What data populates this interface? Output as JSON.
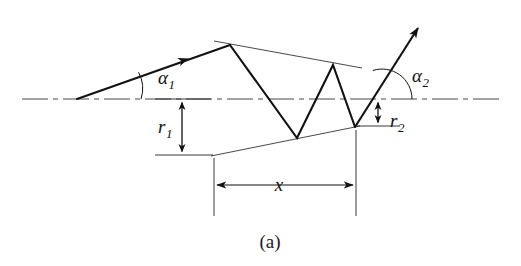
{
  "figure": {
    "caption": "(a)",
    "kind": "ray-diagram",
    "background_color": "#ffffff",
    "stroke_color": "#111111",
    "thin_stroke_color": "#333333"
  },
  "labels": {
    "alpha1": {
      "symbol": "α",
      "subscript": "1",
      "meaning": "incident-angle"
    },
    "alpha2": {
      "symbol": "α",
      "subscript": "2",
      "meaning": "exit-angle"
    },
    "r1": {
      "symbol": "r",
      "subscript": "1",
      "meaning": "entrance-radius"
    },
    "r2": {
      "symbol": "r",
      "subscript": "2",
      "meaning": "exit-radius"
    },
    "x": {
      "symbol": "x",
      "subscript": "",
      "meaning": "axial-distance"
    }
  },
  "geometry": {
    "axis": {
      "y": 99,
      "x_start": 22,
      "x_end": 500,
      "style": "dash-dot"
    },
    "incoming_ray": {
      "from_x": 77,
      "from_y": 99,
      "to_x": 230,
      "to_y": 45,
      "arrow_at_x": 186,
      "arrow_at_y": 60
    },
    "outgoing_ray": {
      "from_x": 355,
      "from_y": 127,
      "to_x": 421,
      "to_y": 24
    },
    "zigzag_points": "230,45 297,138 333,65 355,127",
    "upper_boundary": {
      "x1": 214,
      "y1": 41,
      "x2": 362,
      "y2": 68
    },
    "lower_boundary": {
      "x1": 211,
      "y1": 156,
      "x2": 360,
      "y2": 126
    },
    "r1_dimension": {
      "x": 182,
      "y_top": 99,
      "y_bottom": 155
    },
    "r2_dimension": {
      "x": 378,
      "y_top": 99,
      "y_bottom": 126
    },
    "x_dimension": {
      "y": 185,
      "x_left": 214,
      "x_right": 356
    }
  }
}
